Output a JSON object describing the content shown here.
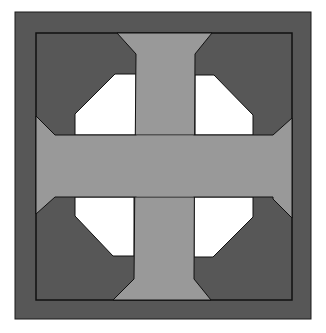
{
  "colors": {
    "background": "#ffffff",
    "outer_border": "#575757",
    "corner_blocks": "#575757",
    "cross": "#999999",
    "openings": "#ffffff",
    "outline": "#1a1a1a"
  },
  "geometry": {
    "outer": [
      15,
      12,
      311,
      319
    ],
    "inner": [
      36,
      33,
      292,
      300
    ]
  }
}
